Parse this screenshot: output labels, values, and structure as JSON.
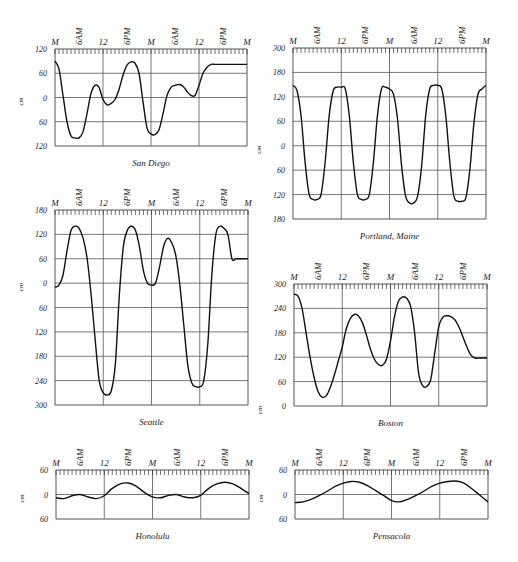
{
  "figure": {
    "x_tick_labels": [
      "M",
      "6AM",
      "12",
      "6PM",
      "M",
      "6AM",
      "12",
      "6PM",
      "M"
    ],
    "y_unit": "cm"
  },
  "chart_data": [
    {
      "id": "san-diego",
      "type": "line",
      "title": "San Diego",
      "xlabel": "time (hours, 2 days)",
      "ylabel": "cm",
      "x_ticks": [
        "M",
        "6AM",
        "12",
        "6PM",
        "M",
        "6AM",
        "12",
        "6PM",
        "M"
      ],
      "y_ticks": [
        "120",
        "60",
        "0",
        "60",
        "120"
      ],
      "ylim": [
        -120,
        120
      ],
      "xlim": [
        0,
        48
      ],
      "grid": true,
      "frame": {
        "left": 55,
        "top": 49,
        "right": 247,
        "bottom": 146
      },
      "x_hours": [
        0,
        1,
        2,
        3,
        4,
        5,
        6,
        7,
        8,
        9,
        10,
        11,
        12,
        13,
        14,
        15,
        16,
        17,
        18,
        19,
        20,
        21,
        22,
        23,
        24,
        25,
        26,
        27,
        28,
        29,
        30,
        31,
        32,
        33,
        34,
        35,
        36,
        37,
        38,
        39,
        40,
        41,
        42,
        43,
        44,
        45,
        46,
        47,
        48
      ],
      "values": [
        90,
        70,
        5,
        -60,
        -95,
        -100,
        -100,
        -85,
        -40,
        10,
        30,
        25,
        -5,
        -18,
        -15,
        -5,
        20,
        55,
        80,
        88,
        85,
        60,
        -10,
        -75,
        -90,
        -92,
        -80,
        -40,
        5,
        25,
        30,
        32,
        28,
        15,
        5,
        5,
        30,
        60,
        75,
        82,
        82,
        82,
        82,
        82,
        82,
        82,
        82,
        82,
        82
      ]
    },
    {
      "id": "portland-maine",
      "type": "line",
      "title": "Portland, Maine",
      "xlabel": "time (hours, 2 days)",
      "ylabel": "cm",
      "x_ticks": [
        "M",
        "6AM",
        "12",
        "6PM",
        "M",
        "6AM",
        "12",
        "6PM",
        "M"
      ],
      "y_ticks": [
        "300",
        "180",
        "120",
        "60",
        "0",
        "60",
        "120",
        "180"
      ],
      "ylim": [
        -180,
        300
      ],
      "grid": true,
      "frame": {
        "left": 293,
        "top": 48,
        "right": 486,
        "bottom": 219
      },
      "x_hours": [
        0,
        1,
        2,
        3,
        4,
        5,
        6,
        7,
        8,
        9,
        10,
        11,
        12,
        13,
        14,
        15,
        16,
        17,
        18,
        19,
        20,
        21,
        22,
        23,
        24,
        25,
        26,
        27,
        28,
        29,
        30,
        31,
        32,
        33,
        34,
        35,
        36,
        37,
        38,
        39,
        40,
        41,
        42,
        43,
        44,
        45,
        46,
        47,
        48
      ],
      "values": [
        195,
        180,
        110,
        -20,
        -110,
        -125,
        -125,
        -110,
        -20,
        110,
        180,
        190,
        190,
        185,
        110,
        -20,
        -110,
        -125,
        -125,
        -110,
        -20,
        110,
        185,
        190,
        185,
        170,
        100,
        -30,
        -115,
        -135,
        -135,
        -115,
        -30,
        110,
        185,
        195,
        195,
        185,
        110,
        -20,
        -115,
        -130,
        -130,
        -120,
        -40,
        90,
        170,
        185,
        195
      ]
    },
    {
      "id": "seattle",
      "type": "line",
      "title": "Seattle",
      "xlabel": "time (hours, 2 days)",
      "ylabel": "cm",
      "x_ticks": [
        "M",
        "6AM",
        "12",
        "6PM",
        "M",
        "6AM",
        "12",
        "6PM",
        "M"
      ],
      "y_ticks": [
        "180",
        "120",
        "60",
        "0",
        "60",
        "120",
        "180",
        "240",
        "300"
      ],
      "ylim": [
        -300,
        180
      ],
      "grid": true,
      "frame": {
        "left": 55,
        "top": 210,
        "right": 248,
        "bottom": 405
      },
      "x_hours": [
        0,
        1,
        2,
        3,
        4,
        5,
        6,
        7,
        8,
        9,
        10,
        11,
        12,
        13,
        14,
        15,
        16,
        17,
        18,
        19,
        20,
        21,
        22,
        23,
        24,
        25,
        26,
        27,
        28,
        29,
        30,
        31,
        32,
        33,
        34,
        35,
        36,
        37,
        38,
        39,
        40,
        41,
        42,
        43,
        44,
        45,
        46,
        47,
        48
      ],
      "values": [
        -10,
        -5,
        20,
        80,
        130,
        140,
        135,
        110,
        60,
        -30,
        -140,
        -240,
        -270,
        -275,
        -265,
        -200,
        -30,
        90,
        130,
        140,
        130,
        90,
        30,
        0,
        -5,
        0,
        40,
        90,
        110,
        100,
        70,
        0,
        -100,
        -200,
        -245,
        -255,
        -255,
        -240,
        -150,
        20,
        120,
        140,
        135,
        120,
        60,
        60,
        60,
        60,
        60
      ]
    },
    {
      "id": "boston",
      "type": "line",
      "title": "Boston",
      "xlabel": "time (hours, 2 days)",
      "ylabel": "cm",
      "x_ticks": [
        "M",
        "6AM",
        "12",
        "6PM",
        "M",
        "6AM",
        "12",
        "6PM",
        "M"
      ],
      "y_ticks": [
        "300",
        "240",
        "180",
        "120",
        "60",
        "0"
      ],
      "ylim": [
        0,
        300
      ],
      "grid": true,
      "frame": {
        "left": 294,
        "top": 284,
        "right": 487,
        "bottom": 406
      },
      "x_hours": [
        0,
        1,
        2,
        3,
        4,
        5,
        6,
        7,
        8,
        9,
        10,
        11,
        12,
        13,
        14,
        15,
        16,
        17,
        18,
        19,
        20,
        21,
        22,
        23,
        24,
        25,
        26,
        27,
        28,
        29,
        30,
        31,
        32,
        33,
        34,
        35,
        36,
        37,
        38,
        39,
        40,
        41,
        42,
        43,
        44,
        45,
        46,
        47,
        48
      ],
      "values": [
        275,
        270,
        240,
        180,
        120,
        70,
        35,
        22,
        25,
        45,
        75,
        110,
        145,
        190,
        215,
        225,
        222,
        205,
        175,
        140,
        115,
        102,
        100,
        115,
        160,
        220,
        258,
        268,
        265,
        245,
        180,
        80,
        50,
        48,
        65,
        130,
        195,
        218,
        222,
        220,
        212,
        195,
        170,
        145,
        125,
        118,
        118,
        118,
        118
      ]
    },
    {
      "id": "honolulu",
      "type": "line",
      "title": "Honolulu",
      "xlabel": "time (hours, 2 days)",
      "ylabel": "cm",
      "x_ticks": [
        "M",
        "6AM",
        "12",
        "6PM",
        "M",
        "6AM",
        "12",
        "6PM",
        "M"
      ],
      "y_ticks": [
        "60",
        "0",
        "60"
      ],
      "ylim": [
        -60,
        60
      ],
      "grid": true,
      "frame": {
        "left": 56,
        "top": 470,
        "right": 249,
        "bottom": 519
      },
      "x_hours": [
        0,
        2,
        4,
        6,
        8,
        10,
        12,
        14,
        16,
        18,
        20,
        22,
        24,
        26,
        28,
        30,
        32,
        34,
        36,
        38,
        40,
        42,
        44,
        46,
        48
      ],
      "values": [
        -8,
        -10,
        -3,
        0,
        -6,
        -10,
        -3,
        15,
        26,
        28,
        20,
        5,
        -6,
        -8,
        -2,
        0,
        -6,
        -8,
        -2,
        15,
        26,
        30,
        26,
        15,
        2
      ]
    },
    {
      "id": "pensacola",
      "type": "line",
      "title": "Pensacola",
      "xlabel": "time (hours, 2 days)",
      "ylabel": "cm",
      "x_ticks": [
        "M",
        "6AM",
        "12",
        "6PM",
        "M",
        "6AM",
        "12",
        "6PM",
        "M"
      ],
      "y_ticks": [
        "60",
        "0",
        "60"
      ],
      "ylim": [
        -60,
        60
      ],
      "grid": true,
      "frame": {
        "left": 295,
        "top": 470,
        "right": 488,
        "bottom": 519
      },
      "x_hours": [
        0,
        2,
        4,
        6,
        8,
        10,
        12,
        14,
        16,
        18,
        20,
        22,
        24,
        26,
        28,
        30,
        32,
        34,
        36,
        38,
        40,
        42,
        44,
        46,
        48
      ],
      "values": [
        -20,
        -18,
        -12,
        -3,
        8,
        20,
        28,
        32,
        30,
        22,
        10,
        -2,
        -15,
        -18,
        -12,
        -3,
        8,
        20,
        28,
        32,
        33,
        28,
        14,
        -2,
        -18
      ]
    }
  ]
}
